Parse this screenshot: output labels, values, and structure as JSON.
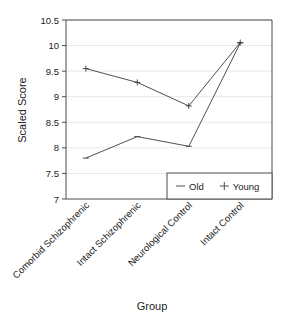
{
  "chart_data": {
    "type": "line",
    "title": "",
    "xlabel": "Group",
    "ylabel": "Scaled Score",
    "categories": [
      "Comorbid Schizophrenic",
      "Intact Schizophrenic",
      "Neurological Control",
      "Intact Control"
    ],
    "series": [
      {
        "name": "Old",
        "marker": "dash",
        "values": [
          7.8,
          8.22,
          8.03,
          10.05
        ]
      },
      {
        "name": "Young",
        "marker": "plus",
        "values": [
          9.55,
          9.28,
          8.82,
          10.06
        ]
      }
    ],
    "ylim": [
      7,
      10.5
    ],
    "yticks": [
      7,
      7.5,
      8,
      8.5,
      9,
      9.5,
      10,
      10.5
    ],
    "ytick_labels": [
      "7",
      "7.5",
      "8",
      "8.5",
      "9",
      "9.5",
      "10",
      "10.5"
    ],
    "grid": true,
    "grid_axis": "y",
    "legend_position": "bottom-right",
    "line_color": "#3c3c3c",
    "grid_color": "#e2e2e2",
    "axis_color": "#4a4a4a",
    "category_label_rotation": -45
  },
  "figure": {
    "background": "#ffffff",
    "name": "scaled-score-by-group-line-chart"
  }
}
